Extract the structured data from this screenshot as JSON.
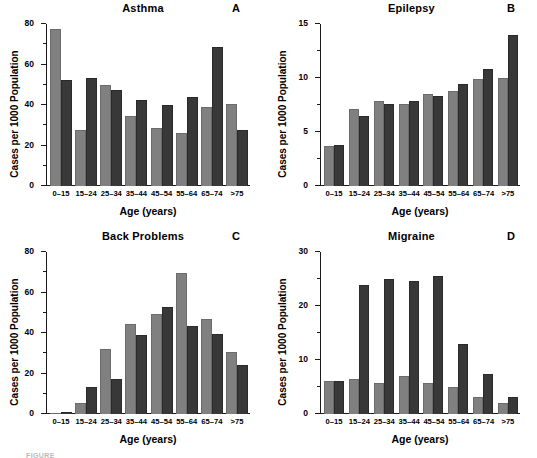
{
  "figure": {
    "ylabel": "Cases per 1000 Population",
    "xlabel": "Age (years)",
    "caption_partial": "FIGURE"
  },
  "chart_data": [
    {
      "type": "bar",
      "panel": "A",
      "title": "Asthma",
      "xlabel": "Age (years)",
      "ylabel": "Cases per 1000 Population",
      "categories": [
        "0–15",
        "15–24",
        "25–34",
        "35–44",
        "45–54",
        "55–64",
        "65–74",
        ">75"
      ],
      "series": [
        {
          "name": "light",
          "color": "#808080",
          "values": [
            77.5,
            27.5,
            50.0,
            34.5,
            28.5,
            26.0,
            39.0,
            40.5
          ]
        },
        {
          "name": "dark",
          "color": "#383838",
          "values": [
            52.5,
            53.5,
            47.5,
            42.5,
            40.0,
            44.0,
            68.5,
            27.5
          ]
        }
      ],
      "ylim": [
        0,
        80
      ],
      "yticks": [
        0,
        20,
        40,
        60,
        80
      ],
      "yminor": [
        10,
        30,
        50,
        70
      ],
      "grid": false,
      "legend": "none"
    },
    {
      "type": "bar",
      "panel": "B",
      "title": "Epilepsy",
      "xlabel": "Age (years)",
      "ylabel": "Cases per 1000 Population",
      "categories": [
        "0–15",
        "15–24",
        "25–34",
        "35–44",
        "45–54",
        "55–64",
        "65–74",
        ">75"
      ],
      "series": [
        {
          "name": "light",
          "color": "#808080",
          "values": [
            3.7,
            7.1,
            7.9,
            7.6,
            8.5,
            8.8,
            9.9,
            10.0
          ]
        },
        {
          "name": "dark",
          "color": "#383838",
          "values": [
            3.8,
            6.5,
            7.6,
            7.9,
            8.3,
            9.4,
            10.8,
            14.0
          ]
        }
      ],
      "ylim": [
        0,
        15
      ],
      "yticks": [
        0,
        5,
        10,
        15
      ],
      "yminor": [
        2.5,
        7.5,
        12.5
      ],
      "grid": false,
      "legend": "none"
    },
    {
      "type": "bar",
      "panel": "C",
      "title": "Back Problems",
      "xlabel": "Age (years)",
      "ylabel": "Cases per 1000 Population",
      "categories": [
        "0–15",
        "15–24",
        "25–34",
        "35–44",
        "45–54",
        "55–64",
        "65–74",
        ">75"
      ],
      "series": [
        {
          "name": "light",
          "color": "#808080",
          "values": [
            0.6,
            5.5,
            32.0,
            44.5,
            49.5,
            69.5,
            47.0,
            30.5
          ]
        },
        {
          "name": "dark",
          "color": "#383838",
          "values": [
            1.2,
            13.5,
            17.5,
            39.0,
            53.0,
            43.5,
            39.5,
            24.0
          ]
        }
      ],
      "ylim": [
        0,
        80
      ],
      "yticks": [
        0,
        20,
        40,
        60,
        80
      ],
      "yminor": [
        10,
        30,
        50,
        70
      ],
      "grid": false,
      "legend": "none"
    },
    {
      "type": "bar",
      "panel": "D",
      "title": "Migraine",
      "xlabel": "Age (years)",
      "ylabel": "Cases per 1000 Population",
      "categories": [
        "0–15",
        "15–24",
        "25–34",
        "35–44",
        "45–54",
        "55–64",
        "65–74",
        ">75"
      ],
      "series": [
        {
          "name": "light",
          "color": "#808080",
          "values": [
            6.2,
            6.4,
            5.8,
            7.0,
            5.8,
            5.0,
            3.2,
            2.1
          ]
        },
        {
          "name": "dark",
          "color": "#383838",
          "values": [
            6.1,
            23.9,
            25.0,
            24.7,
            25.6,
            12.9,
            7.5,
            3.1
          ]
        }
      ],
      "ylim": [
        0,
        30
      ],
      "yticks": [
        0,
        10,
        20,
        30
      ],
      "yminor": [
        5,
        15,
        25
      ],
      "grid": false,
      "legend": "none"
    }
  ]
}
